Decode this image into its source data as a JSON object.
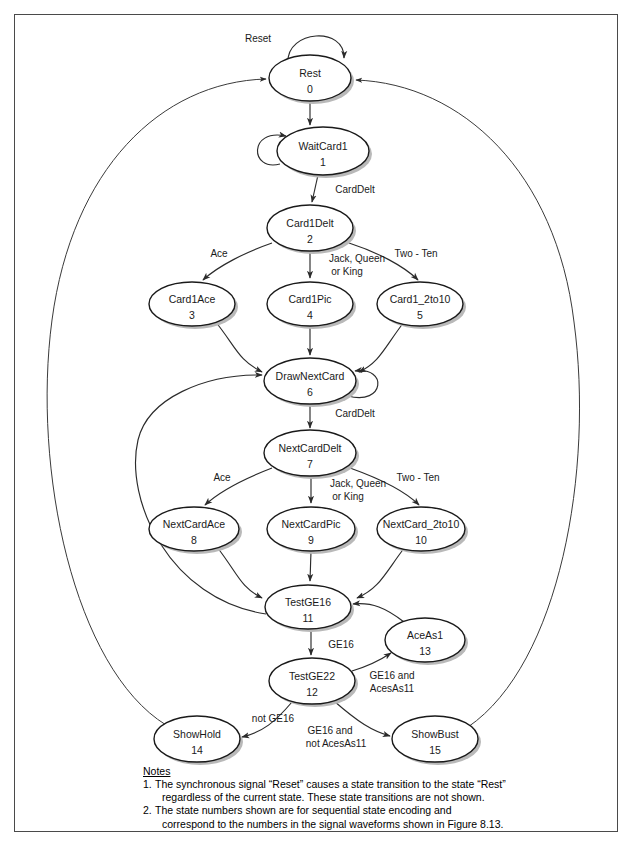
{
  "diagram": {
    "nodes": [
      {
        "id": "rest",
        "label": "Rest",
        "num": "0",
        "cx": 310,
        "cy": 78,
        "rx": 41,
        "ry": 23
      },
      {
        "id": "waitcard1",
        "label": "WaitCard1",
        "num": "1",
        "cx": 323,
        "cy": 151,
        "rx": 46,
        "ry": 24
      },
      {
        "id": "card1delt",
        "label": "Card1Delt",
        "num": "2",
        "cx": 310,
        "cy": 228,
        "rx": 43,
        "ry": 23
      },
      {
        "id": "card1ace",
        "label": "Card1Ace",
        "num": "3",
        "cx": 192,
        "cy": 304,
        "rx": 43,
        "ry": 22
      },
      {
        "id": "card1pic",
        "label": "Card1Pic",
        "num": "4",
        "cx": 310,
        "cy": 304,
        "rx": 43,
        "ry": 22
      },
      {
        "id": "card1_2to10",
        "label": "Card1_2to10",
        "num": "5",
        "cx": 420,
        "cy": 304,
        "rx": 43,
        "ry": 22
      },
      {
        "id": "drawnextcard",
        "label": "DrawNextCard",
        "num": "6",
        "cx": 310,
        "cy": 381,
        "rx": 46,
        "ry": 23
      },
      {
        "id": "nextcarddelt",
        "label": "NextCardDelt",
        "num": "7",
        "cx": 310,
        "cy": 453,
        "rx": 46,
        "ry": 23
      },
      {
        "id": "nextcardace",
        "label": "NextCardAce",
        "num": "8",
        "cx": 194,
        "cy": 529,
        "rx": 45,
        "ry": 22
      },
      {
        "id": "nextcardpic",
        "label": "NextCardPic",
        "num": "9",
        "cx": 311,
        "cy": 529,
        "rx": 44,
        "ry": 22
      },
      {
        "id": "nextcard_2to10",
        "label": "NextCard_2to10",
        "num": "10",
        "cx": 421,
        "cy": 529,
        "rx": 44,
        "ry": 22
      },
      {
        "id": "testge16",
        "label": "TestGE16",
        "num": "11",
        "cx": 308,
        "cy": 607,
        "rx": 43,
        "ry": 22
      },
      {
        "id": "testge22",
        "label": "TestGE22",
        "num": "12",
        "cx": 312,
        "cy": 681,
        "rx": 43,
        "ry": 23
      },
      {
        "id": "aceas1",
        "label": "AceAs1",
        "num": "13",
        "cx": 425,
        "cy": 640,
        "rx": 40,
        "ry": 22
      },
      {
        "id": "showhold",
        "label": "ShowHold",
        "num": "14",
        "cx": 197,
        "cy": 739,
        "rx": 43,
        "ry": 23
      },
      {
        "id": "showbust",
        "label": "ShowBust",
        "num": "15",
        "cx": 435,
        "cy": 739,
        "rx": 43,
        "ry": 23
      }
    ],
    "edge_labels": [
      {
        "id": "reset",
        "text": "Reset",
        "x": 258,
        "y": 42
      },
      {
        "id": "carddelt1",
        "text": "CardDelt",
        "x": 355,
        "y": 193
      },
      {
        "id": "ace1",
        "text": "Ace",
        "x": 219,
        "y": 257
      },
      {
        "id": "jackqueen1-a",
        "text": "Jack, Queen",
        "x": 357,
        "y": 262
      },
      {
        "id": "jackqueen1-b",
        "text": "or King",
        "x": 347,
        "y": 275
      },
      {
        "id": "twoten1",
        "text": "Two - Ten",
        "x": 416,
        "y": 257
      },
      {
        "id": "carddelt2",
        "text": "CardDelt",
        "x": 355,
        "y": 417
      },
      {
        "id": "ace2",
        "text": "Ace",
        "x": 222,
        "y": 481
      },
      {
        "id": "jackqueen2-a",
        "text": "Jack, Queen",
        "x": 358,
        "y": 487
      },
      {
        "id": "jackqueen2-b",
        "text": "or King",
        "x": 348,
        "y": 500
      },
      {
        "id": "twoten2",
        "text": "Two - Ten",
        "x": 418,
        "y": 481
      },
      {
        "id": "ge16",
        "text": "GE16",
        "x": 341,
        "y": 648
      },
      {
        "id": "ge16-aces-a",
        "text": "GE16 and",
        "x": 392,
        "y": 679
      },
      {
        "id": "ge16-aces-b",
        "text": "AcesAs11",
        "x": 392,
        "y": 692
      },
      {
        "id": "notge16",
        "text": "not GE16",
        "x": 273,
        "y": 722
      },
      {
        "id": "ge16-notaces-a",
        "text": "GE16 and",
        "x": 330,
        "y": 734
      },
      {
        "id": "ge16-notaces-b",
        "text": "not AcesAs11",
        "x": 336,
        "y": 747
      }
    ]
  },
  "notes": {
    "heading": "Notes",
    "items": [
      {
        "num": "1.",
        "line1": "The synchronous signal “Reset” causes a state transition to the state “Rest”",
        "line2": "regardless of the current state. These state transitions are not shown."
      },
      {
        "num": "2.",
        "line1": "The state numbers shown are for sequential state encoding and",
        "line2": "correspond to the numbers in the signal waveforms shown in Figure 8.13."
      }
    ]
  },
  "colors": {
    "stroke": "#2b2b2b",
    "node_fill": "#ffffff",
    "shadow": "#b9b9b9",
    "frame": "#4a4a4a"
  }
}
